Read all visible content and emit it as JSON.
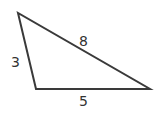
{
  "diagram": {
    "type": "triangle",
    "stroke_color": "#3a3a3a",
    "vertices": [
      [
        18,
        13
      ],
      [
        36,
        89
      ],
      [
        150,
        89
      ]
    ],
    "sides": [
      {
        "label": "3",
        "between": "left-top to bottom-left"
      },
      {
        "label": "8",
        "between": "left-top to bottom-right"
      },
      {
        "label": "5",
        "between": "bottom-left to bottom-right"
      }
    ]
  }
}
